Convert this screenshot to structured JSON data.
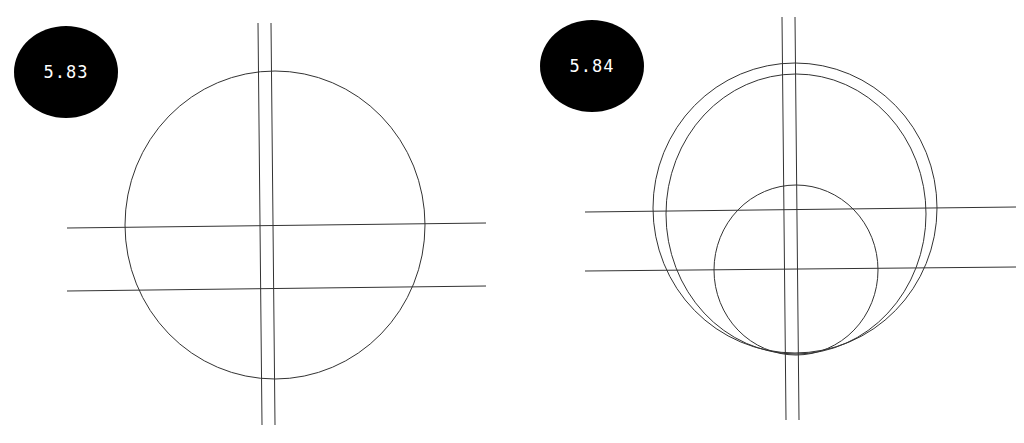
{
  "panels": [
    {
      "label": "5.83",
      "badge": {
        "cx": 66,
        "cy": 72,
        "rx": 52,
        "ry": 46
      },
      "vertical_lines": [
        {
          "x1": 258,
          "y1": 23,
          "x2": 262,
          "y2": 425
        },
        {
          "x1": 271,
          "y1": 23,
          "x2": 275,
          "y2": 425
        }
      ],
      "horizontal_lines": [
        {
          "x1": 67,
          "y1": 228,
          "x2": 486,
          "y2": 223
        },
        {
          "x1": 67,
          "y1": 291,
          "x2": 486,
          "y2": 286
        }
      ],
      "circles": [
        {
          "cx": 275,
          "cy": 225,
          "rx": 150,
          "ry": 154
        }
      ]
    },
    {
      "label": "5.84",
      "badge": {
        "cx": 592,
        "cy": 66,
        "rx": 52,
        "ry": 46
      },
      "vertical_lines": [
        {
          "x1": 782,
          "y1": 17,
          "x2": 786,
          "y2": 420
        },
        {
          "x1": 795,
          "y1": 17,
          "x2": 799,
          "y2": 420
        }
      ],
      "horizontal_lines": [
        {
          "x1": 585,
          "y1": 212,
          "x2": 1016,
          "y2": 207
        },
        {
          "x1": 585,
          "y1": 271,
          "x2": 1016,
          "y2": 267
        }
      ],
      "circles": [
        {
          "cx": 795,
          "cy": 208,
          "rx": 142,
          "ry": 145
        },
        {
          "cx": 796,
          "cy": 214,
          "rx": 130,
          "ry": 140
        },
        {
          "cx": 796,
          "cy": 270,
          "rx": 82,
          "ry": 85
        }
      ]
    }
  ],
  "colors": {
    "line": "#333333",
    "badge": "#000000",
    "badge_text": "#ffffff"
  }
}
